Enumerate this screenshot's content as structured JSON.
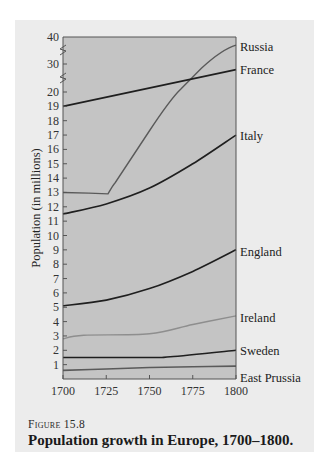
{
  "figure": {
    "label": "Figure 15.8",
    "title": "Population growth in Europe, 1700–1800."
  },
  "colors": {
    "page_bg": "#ececec",
    "plot_bg": "#c4c4c4",
    "axis": "#555555",
    "dark_line": "#1f1f1f",
    "mid_line": "#5a5a5a",
    "light_line": "#8e8e8e"
  },
  "chart_data": {
    "type": "line",
    "title": "Population growth in Europe, 1700–1800.",
    "xlabel": "",
    "ylabel": "Population (in millions)",
    "x": [
      1700,
      1725,
      1750,
      1775,
      1800
    ],
    "xticks": [
      "1700",
      "1725",
      "1750",
      "1775",
      "1800"
    ],
    "yticks": [
      "1",
      "2",
      "3",
      "4",
      "5",
      "6",
      "7",
      "8",
      "9",
      "10",
      "11",
      "12",
      "13",
      "14",
      "15",
      "16",
      "17",
      "18",
      "19",
      "20",
      "30",
      "40"
    ],
    "ylim": [
      0,
      40
    ],
    "y_axis_breaks": [
      [
        20,
        30
      ],
      [
        30,
        40
      ]
    ],
    "grid": false,
    "legend": "direct labels at right end of each line",
    "series": [
      {
        "name": "Russia",
        "values": [
          13.0,
          12.9,
          17.5,
          28.0,
          37.0
        ],
        "color": "#5a5a5a"
      },
      {
        "name": "France",
        "values": [
          19.0,
          21.0,
          23.5,
          26.0,
          28.0
        ],
        "color": "#1f1f1f"
      },
      {
        "name": "Italy",
        "values": [
          11.5,
          12.2,
          13.3,
          15.0,
          17.0
        ],
        "color": "#1f1f1f"
      },
      {
        "name": "England",
        "values": [
          5.1,
          5.5,
          6.3,
          7.5,
          9.0
        ],
        "color": "#1f1f1f"
      },
      {
        "name": "Ireland",
        "values": [
          2.8,
          3.1,
          3.2,
          3.8,
          4.4
        ],
        "color": "#8e8e8e"
      },
      {
        "name": "Sweden",
        "values": [
          1.5,
          1.5,
          1.5,
          1.7,
          2.0
        ],
        "color": "#1f1f1f"
      },
      {
        "name": "East Prussia",
        "values": [
          0.6,
          0.7,
          0.8,
          0.85,
          0.9
        ],
        "color": "#5a5a5a"
      }
    ]
  }
}
